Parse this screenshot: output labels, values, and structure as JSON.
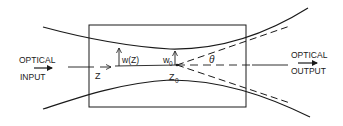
{
  "diagram": {
    "input_label_line1": "OPTICAL",
    "input_label_line2": "INPUT",
    "output_label_line1": "OPTICAL",
    "output_label_line2": "OUTPUT",
    "z_label": "Z",
    "wz_label": "w(Z)",
    "w0_label": "w",
    "w0_sub": "0",
    "z0_label": "Z",
    "z0_sub": "0",
    "theta_label": "θ"
  },
  "colors": {
    "stroke": "#1a1a1a",
    "background": "#ffffff"
  }
}
